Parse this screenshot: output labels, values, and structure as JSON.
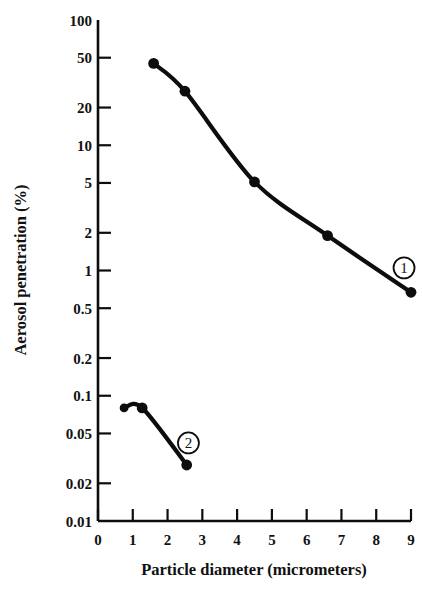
{
  "chart_data": {
    "type": "line",
    "title": "",
    "xlabel": "Particle diameter (micrometers)",
    "ylabel": "Aerosol penetration (%)",
    "xscale": "linear",
    "yscale": "log",
    "xlim": [
      0,
      9
    ],
    "ylim": [
      0.01,
      100
    ],
    "grid": false,
    "legend": "inline annotations",
    "xticks": [
      "0",
      "1",
      "2",
      "3",
      "4",
      "5",
      "6",
      "7",
      "8",
      "9"
    ],
    "xtick_values": [
      0,
      1,
      2,
      3,
      4,
      5,
      6,
      7,
      8,
      9
    ],
    "yticks": [
      "100",
      "50",
      "20",
      "10",
      "5",
      "2",
      "1",
      "0.5",
      "0.2",
      "0.1",
      "0.05",
      "0.02",
      "0.01"
    ],
    "ytick_values": [
      100,
      50,
      20,
      10,
      5,
      2,
      1,
      0.5,
      0.2,
      0.1,
      0.05,
      0.02,
      0.01
    ],
    "series": [
      {
        "name": "1",
        "annotation": "1",
        "x": [
          1.6,
          2.5,
          4.5,
          6.6,
          9.0
        ],
        "values": [
          45,
          27,
          5.1,
          1.9,
          0.67
        ]
      },
      {
        "name": "2",
        "annotation": "2",
        "x": [
          0.75,
          1.27,
          2.55
        ],
        "values": [
          0.08,
          0.08,
          0.028
        ]
      }
    ],
    "annotations": [
      {
        "label": "1",
        "x": 8.8,
        "y": 1.05
      },
      {
        "label": "2",
        "x": 2.6,
        "y": 0.042
      }
    ]
  },
  "colors": {
    "ink": "#0d0d0d",
    "background": "#ffffff"
  }
}
